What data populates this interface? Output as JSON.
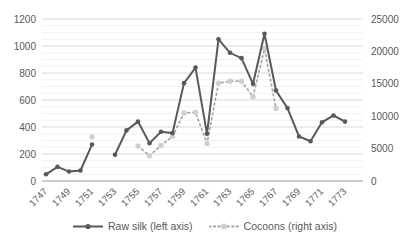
{
  "chart_data": {
    "type": "line",
    "title": "",
    "x": [
      1747,
      1748,
      1749,
      1750,
      1751,
      1752,
      1753,
      1754,
      1755,
      1756,
      1757,
      1758,
      1759,
      1760,
      1761,
      1762,
      1763,
      1764,
      1765,
      1766,
      1767,
      1768,
      1769,
      1770,
      1771,
      1772,
      1773
    ],
    "x_tick_labels": [
      "1747",
      "1749",
      "1751",
      "1753",
      "1755",
      "1757",
      "1759",
      "1761",
      "1763",
      "1765",
      "1767",
      "1769",
      "1771",
      "1773"
    ],
    "series": [
      {
        "name": "Raw silk (left axis)",
        "axis": "left",
        "color": "#595959",
        "line_style": "solid",
        "marker": "circle",
        "values": [
          50,
          105,
          70,
          78,
          270,
          null,
          195,
          375,
          440,
          280,
          365,
          355,
          725,
          840,
          350,
          1050,
          950,
          910,
          720,
          1090,
          670,
          540,
          330,
          295,
          435,
          485,
          440
        ]
      },
      {
        "name": "Cocoons (right axis)",
        "axis": "right",
        "color": "#a6a6a6",
        "marker_color": "#cfcfcf",
        "line_style": "dotted",
        "marker": "circle",
        "values": [
          null,
          null,
          null,
          null,
          6800,
          null,
          null,
          null,
          5400,
          3900,
          5500,
          6900,
          10500,
          10600,
          5800,
          15100,
          15400,
          15400,
          13000,
          20400,
          11200,
          null,
          null,
          null,
          null,
          null,
          null
        ]
      }
    ],
    "left_axis": {
      "min": 0,
      "max": 1200,
      "tick_step": 200,
      "ticks": [
        "0",
        "200",
        "400",
        "600",
        "800",
        "1000",
        "1200"
      ]
    },
    "right_axis": {
      "min": 0,
      "max": 25000,
      "tick_step": 5000,
      "ticks": [
        "0",
        "5000",
        "10000",
        "15000",
        "20000",
        "25000"
      ]
    },
    "grid": {
      "major": true,
      "minor": true,
      "minor_step_left": 50
    },
    "legend_position": "bottom"
  },
  "colors": {
    "major_grid": "#d9d9d9",
    "minor_grid": "#f2f2f2",
    "axis_line": "#9b9b9b",
    "text": "#595959",
    "background": "#ffffff"
  }
}
